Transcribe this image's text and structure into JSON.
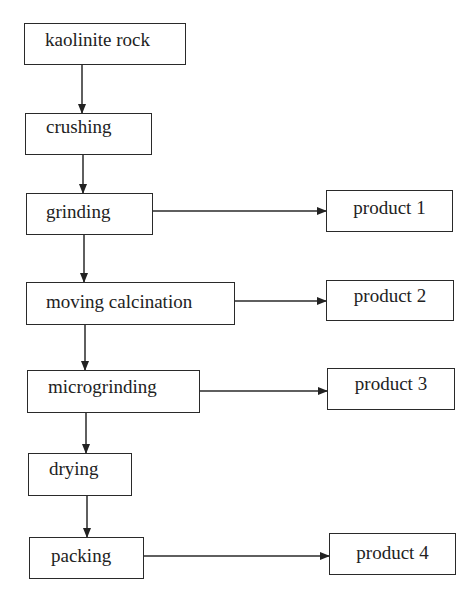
{
  "diagram": {
    "type": "process-flowchart",
    "steps": [
      {
        "id": "kaolinite_rock",
        "label": "kaolinite rock"
      },
      {
        "id": "crushing",
        "label": "crushing"
      },
      {
        "id": "grinding",
        "label": "grinding"
      },
      {
        "id": "moving_calcination",
        "label": "moving calcination"
      },
      {
        "id": "microgrinding",
        "label": "microgrinding"
      },
      {
        "id": "drying",
        "label": "drying"
      },
      {
        "id": "packing",
        "label": "packing"
      }
    ],
    "products": [
      {
        "id": "product1",
        "label": "product 1",
        "from": "grinding"
      },
      {
        "id": "product2",
        "label": "product 2",
        "from": "moving_calcination"
      },
      {
        "id": "product3",
        "label": "product 3",
        "from": "microgrinding"
      },
      {
        "id": "product4",
        "label": "product 4",
        "from": "packing"
      }
    ],
    "edges": [
      [
        "kaolinite_rock",
        "crushing"
      ],
      [
        "crushing",
        "grinding"
      ],
      [
        "grinding",
        "moving_calcination"
      ],
      [
        "moving_calcination",
        "microgrinding"
      ],
      [
        "microgrinding",
        "drying"
      ],
      [
        "drying",
        "packing"
      ],
      [
        "grinding",
        "product1"
      ],
      [
        "moving_calcination",
        "product2"
      ],
      [
        "microgrinding",
        "product3"
      ],
      [
        "packing",
        "product4"
      ]
    ]
  }
}
